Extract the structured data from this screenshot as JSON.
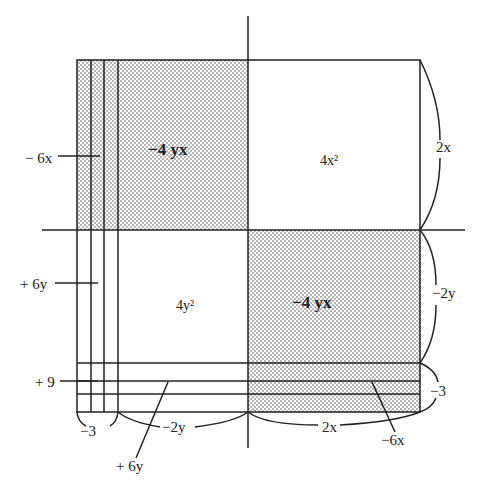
{
  "diagram": {
    "regions": {
      "top_left": "−4 yx",
      "top_right": "4x²",
      "bottom_left": "4y²",
      "bottom_right": "−4 yx"
    },
    "side_labels": {
      "right_top": "2x",
      "right_middle": "−2y",
      "right_bottom": "−3",
      "bottom_left": "−3",
      "bottom_middle": "−2y",
      "bottom_right": "2x"
    },
    "pointer_labels": {
      "left_top": "− 6x",
      "left_middle": "+ 6y",
      "left_bottom": "+ 9",
      "bottom_pointer_left": "+ 6y",
      "bottom_pointer_right": "−6x"
    },
    "colors": {
      "line": "#222222",
      "dots": "#555555",
      "background": "#ffffff"
    }
  }
}
